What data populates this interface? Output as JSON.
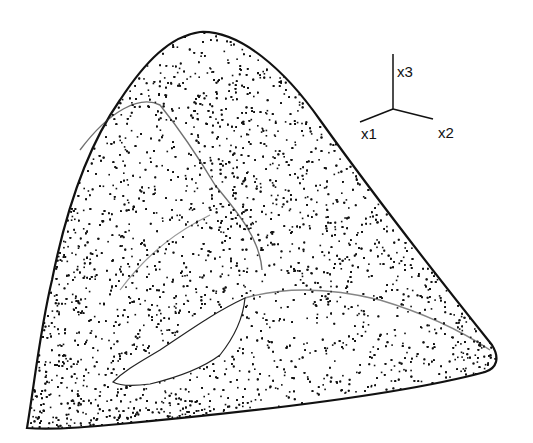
{
  "figure": {
    "ink_color": "#111111",
    "background": "#ffffff"
  },
  "axes_triad": {
    "labels": {
      "x1": "x1",
      "x2": "x2",
      "x3": "x3"
    }
  }
}
